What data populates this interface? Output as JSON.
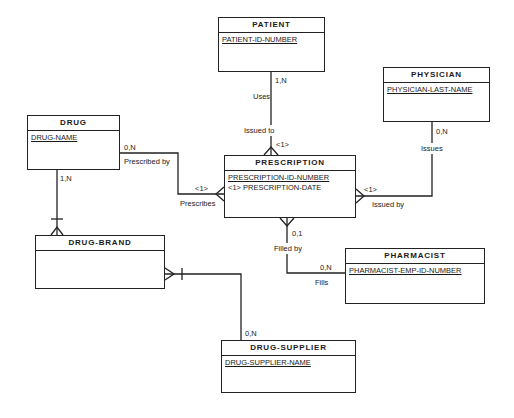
{
  "diagram": {
    "type": "entity-relationship",
    "entities": {
      "patient": {
        "name": "PATIENT",
        "attributes": [
          {
            "text": "PATIENT-ID-NUMBER",
            "key": true
          }
        ]
      },
      "physician": {
        "name": "PHYSICIAN",
        "attributes": [
          {
            "text": "PHYSICIAN-LAST-NAME",
            "key": true
          }
        ]
      },
      "drug": {
        "name": "DRUG",
        "attributes": [
          {
            "text": "DRUG-NAME",
            "key": true
          }
        ]
      },
      "prescription": {
        "name": "PRESCRIPTION",
        "attributes": [
          {
            "text": "PRESCRIPTION-ID-NUMBER",
            "key": true
          },
          {
            "text": "<1> PRESCRIPTION-DATE",
            "key": false
          }
        ]
      },
      "drug_brand": {
        "name": "DRUG-BRAND",
        "attributes": []
      },
      "pharmacist": {
        "name": "PHARMACIST",
        "attributes": [
          {
            "text": "PHARMACIST-EMP-ID-NUMBER",
            "key": true
          }
        ]
      },
      "drug_supplier": {
        "name": "DRUG-SUPPLIER",
        "attributes": [
          {
            "text": "DRUG-SUPPLIER-NAME",
            "key": true
          }
        ]
      }
    },
    "relationships": {
      "patient_prescription": {
        "from": "PATIENT",
        "to": "PRESCRIPTION",
        "from_card": "1,N",
        "from_role": "Uses",
        "to_role": "Issued to",
        "to_card": "<1>"
      },
      "physician_prescription": {
        "from": "PHYSICIAN",
        "to": "PRESCRIPTION",
        "from_card": "0,N",
        "from_role": "Issues",
        "to_role": "Issued by",
        "to_card": "<1>"
      },
      "drug_prescription": {
        "from": "DRUG",
        "to": "PRESCRIPTION",
        "from_card": "0,N",
        "from_role": "Prescribed by",
        "to_role": "Prescribes",
        "to_card": "<1>"
      },
      "prescription_pharmacist": {
        "from": "PRESCRIPTION",
        "to": "PHARMACIST",
        "from_card": "0,1",
        "from_role": "Filled by",
        "to_role": "Fills",
        "to_card": "0,N"
      },
      "drug_drugbrand": {
        "from": "DRUG",
        "to": "DRUG-BRAND",
        "from_card": "1,N"
      },
      "drugbrand_supplier": {
        "from": "DRUG-BRAND",
        "to": "DRUG-SUPPLIER",
        "to_card": "0,N"
      }
    }
  }
}
